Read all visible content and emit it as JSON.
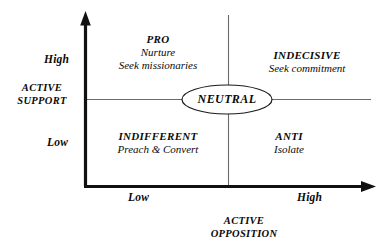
{
  "diagram": {
    "type": "2x2-matrix",
    "title": "",
    "axes": {
      "y": {
        "title": "ACTIVE SUPPORT",
        "title_line1": "ACTIVE",
        "title_line2": "SUPPORT",
        "high_label": "High",
        "low_label": "Low"
      },
      "x": {
        "title": "ACTIVE OPPOSITION",
        "title_line1": "ACTIVE",
        "title_line2": "OPPOSITION",
        "low_label": "Low",
        "high_label": "High"
      }
    },
    "center": {
      "label": "NEUTRAL",
      "shape": "ellipse"
    },
    "quadrants": [
      {
        "id": "pro",
        "position": "top-left",
        "title": "PRO",
        "lines": [
          "Nurture",
          "Seek missionaries"
        ]
      },
      {
        "id": "indecisive",
        "position": "top-right",
        "title": "INDECISIVE",
        "lines": [
          "Seek commitment"
        ]
      },
      {
        "id": "indifferent",
        "position": "bottom-left",
        "title": "INDIFFERENT",
        "lines": [
          "Preach & Convert"
        ]
      },
      {
        "id": "anti",
        "position": "bottom-right",
        "title": "ANTI",
        "lines": [
          "Isolate"
        ]
      }
    ],
    "colors": {
      "axis": "#111111",
      "divider": "#6b6b6b",
      "text": "#0a0a0a",
      "background": "#ffffff"
    }
  }
}
